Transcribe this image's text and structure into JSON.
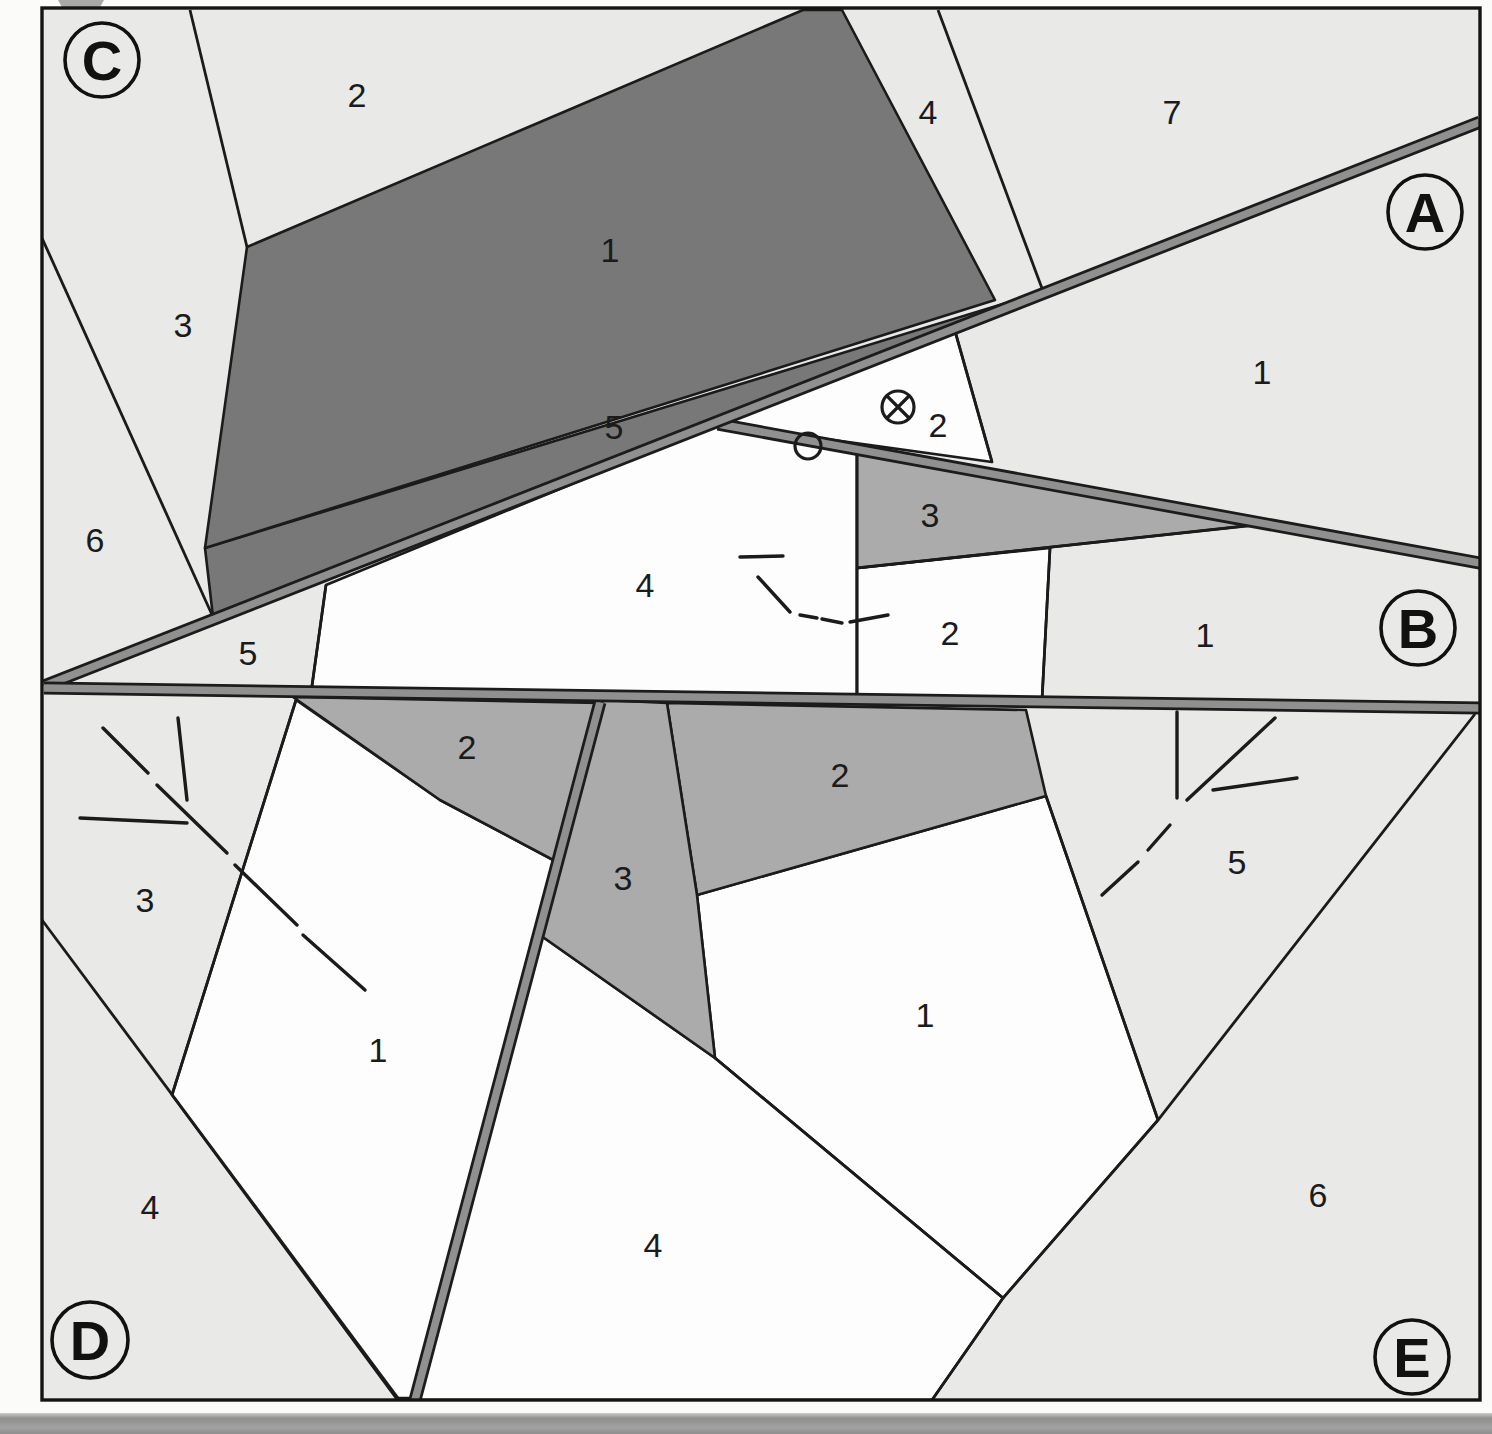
{
  "figure": {
    "blocks": [
      {
        "badge": "C",
        "units": [
          "1",
          "2",
          "3",
          "4",
          "5",
          "6",
          "7"
        ],
        "position": "top-left"
      },
      {
        "badge": "A",
        "units": [
          "1",
          "2"
        ],
        "position": "top-right wedge between faults"
      },
      {
        "badge": "B",
        "units": [
          "1",
          "2",
          "3",
          "4",
          "5"
        ],
        "position": "middle band"
      },
      {
        "badge": "D",
        "units": [
          "1",
          "2",
          "3",
          "4"
        ],
        "position": "bottom-left"
      },
      {
        "badge": "E",
        "units": [
          "1",
          "2",
          "3",
          "4",
          "5",
          "6"
        ],
        "position": "bottom-right"
      }
    ]
  },
  "badges": [
    {
      "text": "C"
    },
    {
      "text": "A"
    },
    {
      "text": "B"
    },
    {
      "text": "D"
    },
    {
      "text": "E"
    }
  ],
  "unit_labels": [
    {
      "block": "C",
      "text": "2"
    },
    {
      "block": "C",
      "text": "4"
    },
    {
      "block": "C",
      "text": "7"
    },
    {
      "block": "C",
      "text": "1"
    },
    {
      "block": "C",
      "text": "3"
    },
    {
      "block": "C",
      "text": "5"
    },
    {
      "block": "C",
      "text": "6"
    },
    {
      "block": "A",
      "text": "1"
    },
    {
      "block": "A",
      "text": "2"
    },
    {
      "block": "B",
      "text": "3"
    },
    {
      "block": "B",
      "text": "4"
    },
    {
      "block": "B",
      "text": "2"
    },
    {
      "block": "B",
      "text": "1"
    },
    {
      "block": "B",
      "text": "5"
    },
    {
      "block": "D",
      "text": "2"
    },
    {
      "block": "E",
      "text": "2"
    },
    {
      "block": "E",
      "text": "5"
    },
    {
      "block": "E",
      "text": "3"
    },
    {
      "block": "D",
      "text": "3"
    },
    {
      "block": "E",
      "text": "1"
    },
    {
      "block": "D",
      "text": "1"
    },
    {
      "block": "E",
      "text": "6"
    },
    {
      "block": "D",
      "text": "4"
    },
    {
      "block": "E",
      "text": "4"
    }
  ],
  "map_symbols": [
    {
      "name": "crossed-circle-symbol",
      "meaning": "circle with X marker in unit A-2"
    },
    {
      "name": "open-circle-symbol",
      "meaning": "open circle marker on fault between blocks A and B"
    },
    {
      "name": "form-lines-dashed",
      "meaning": "solid and dashed structural trace lines in units B-4, D-3 and E-5"
    }
  ],
  "faults": [
    {
      "name": "fault-C-A",
      "trend": "from left edge rising to top-right corner"
    },
    {
      "name": "fault-A-B",
      "trend": "branches eastward to right edge"
    },
    {
      "name": "fault-B-DE",
      "trend": "near-horizontal across full width"
    },
    {
      "name": "fault-D-E",
      "trend": "near-vertical through lower half"
    }
  ],
  "colors": {
    "unit_dark": "#787878",
    "unit_medium": "#ababab",
    "unit_light": "#e9e9e7",
    "unit_white": "#fdfdfd",
    "fault_fill": "#909090",
    "line": "#1b1b1b",
    "page": "#fbfbfa",
    "page_edge_strip": "#9b9b9b"
  }
}
